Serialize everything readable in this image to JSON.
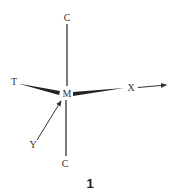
{
  "diagram": {
    "atoms": {
      "center": "M",
      "top": "C",
      "bottom": "C",
      "left": "T",
      "right": "X",
      "lower_left": "Y"
    },
    "bonds": [
      {
        "from": "M",
        "to": "C (top)",
        "style": "plain"
      },
      {
        "from": "M",
        "to": "C (bottom)",
        "style": "plain"
      },
      {
        "from": "T",
        "to": "M",
        "style": "wedge"
      },
      {
        "from": "M",
        "to": "X",
        "style": "wedge"
      },
      {
        "from": "Y",
        "to": "M",
        "style": "arrow"
      },
      {
        "from": "X",
        "to": "right",
        "style": "arrow"
      }
    ],
    "caption": "1",
    "colors": {
      "ink": "#333333",
      "background": "#ffffff"
    }
  }
}
